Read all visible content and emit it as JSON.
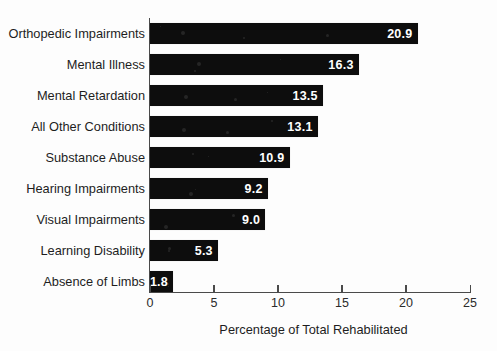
{
  "chart_data": {
    "type": "bar",
    "orientation": "horizontal",
    "title": "",
    "xlabel": "Percentage of Total Rehabilitated",
    "ylabel": "",
    "xlim": [
      0,
      25
    ],
    "xticks": [
      0,
      5,
      10,
      15,
      20,
      25
    ],
    "xtick_labels": [
      "0",
      "5",
      "10",
      "15",
      "20",
      "25"
    ],
    "grid": false,
    "legend": false,
    "categories": [
      "Orthopedic Impairments",
      "Mental Illness",
      "Mental Retardation",
      "All Other Conditions",
      "Substance Abuse",
      "Hearing Impairments",
      "Visual Impairments",
      "Learning Disability",
      "Absence of Limbs"
    ],
    "values": [
      20.9,
      16.3,
      13.5,
      13.1,
      10.9,
      9.2,
      9.0,
      5.3,
      1.8
    ],
    "value_labels": [
      "20.9",
      "16.3",
      "13.5",
      "13.1",
      "10.9",
      "9.2",
      "9.0",
      "5.3",
      "1.8"
    ],
    "bar_color": "#0d0d0d",
    "value_label_color": "#ffffff",
    "axis_color": "#4a4a4a",
    "background_color": "#fdfdfd"
  }
}
